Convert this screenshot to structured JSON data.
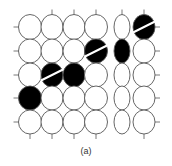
{
  "caption": "(a)",
  "grid": {
    "columns": [
      {
        "cx": 30,
        "rx": 11.5
      },
      {
        "cx": 52,
        "rx": 11
      },
      {
        "cx": 74,
        "rx": 11
      },
      {
        "cx": 96,
        "rx": 11.5
      },
      {
        "cx": 122,
        "rx": 8
      },
      {
        "cx": 144,
        "rx": 11
      }
    ],
    "rows": [
      {
        "cy": 27,
        "ry": 12.5
      },
      {
        "cy": 51,
        "ry": 12
      },
      {
        "cy": 75,
        "ry": 12
      },
      {
        "cy": 98,
        "ry": 12
      },
      {
        "cy": 122,
        "ry": 12
      }
    ],
    "filled_cells": [
      {
        "col": 5,
        "row": 0,
        "stripe": true
      },
      {
        "col": 3,
        "row": 1,
        "stripe": true
      },
      {
        "col": 4,
        "row": 1,
        "stripe": false
      },
      {
        "col": 1,
        "row": 2,
        "stripe": true
      },
      {
        "col": 2,
        "row": 2,
        "stripe": false
      },
      {
        "col": 0,
        "row": 3,
        "stripe": false
      }
    ]
  },
  "colors": {
    "stroke": "#555555",
    "fill": "#000000",
    "stripe": "#ffffff"
  }
}
